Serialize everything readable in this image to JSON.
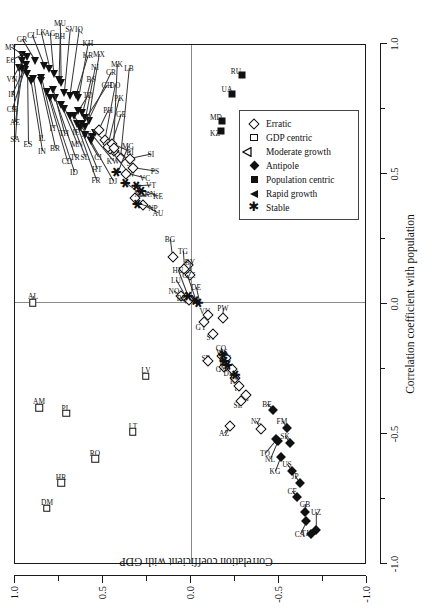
{
  "chart_data": {
    "type": "scatter",
    "title": "",
    "xlabel": "Correlation coefficient with population",
    "ylabel": "Correlation coefficient with GDP",
    "xlim": [
      -1.0,
      1.0
    ],
    "ylim": [
      -1.0,
      1.0
    ],
    "xticks": [
      "-1.0",
      "-0.5",
      "0.0",
      "0.5",
      "1.0"
    ],
    "yticks": [
      "1.0",
      "0.5",
      "0.0",
      "-0.5",
      "-1.0"
    ],
    "grid": false,
    "zero_lines": true,
    "legend_position": "lower right",
    "legend": [
      {
        "label": "Erratic",
        "marker": "open-diamond"
      },
      {
        "label": "GDP centric",
        "marker": "open-square"
      },
      {
        "label": "Moderate growth",
        "marker": "open-triangle-left"
      },
      {
        "label": "Antipole",
        "marker": "filled-diamond"
      },
      {
        "label": "Population centric",
        "marker": "filled-square"
      },
      {
        "label": "Rapid growth",
        "marker": "filled-triangle-left"
      },
      {
        "label": "Stable",
        "marker": "asterisk"
      }
    ],
    "series": [
      {
        "name": "Rapid growth",
        "marker": "filled-triangle-left",
        "points": [
          {
            "label": "SA",
            "x": 0.905,
            "y": 0.975,
            "lx": 0.63,
            "ly": 1.0
          },
          {
            "label": "AE",
            "x": 0.9,
            "y": 0.96,
            "lx": 0.695,
            "ly": 1.0
          },
          {
            "label": "CH",
            "x": 0.898,
            "y": 0.945,
            "lx": 0.745,
            "ly": 1.015
          },
          {
            "label": "IR",
            "x": 0.915,
            "y": 0.94,
            "lx": 0.805,
            "ly": 1.015
          },
          {
            "label": "VN",
            "x": 0.93,
            "y": 0.96,
            "lx": 0.862,
            "ly": 1.015
          },
          {
            "label": "EG",
            "x": 0.955,
            "y": 0.96,
            "lx": 0.935,
            "ly": 1.02
          },
          {
            "label": "MY",
            "x": 0.945,
            "y": 0.93,
            "lx": 0.985,
            "ly": 1.02
          },
          {
            "label": "GR",
            "x": 0.93,
            "y": 0.885,
            "lx": 1.015,
            "ly": 0.96
          },
          {
            "label": "ES",
            "x": 0.88,
            "y": 0.93,
            "lx": 0.612,
            "ly": 0.925
          },
          {
            "label": "IN",
            "x": 0.852,
            "y": 0.91,
            "lx": 0.583,
            "ly": 0.845
          },
          {
            "label": "IL",
            "x": 0.862,
            "y": 0.895,
            "lx": 0.633,
            "ly": 0.845
          },
          {
            "label": "BR",
            "x": 0.852,
            "y": 0.855,
            "lx": 0.595,
            "ly": 0.77
          },
          {
            "label": "IT",
            "x": 0.866,
            "y": 0.85,
            "lx": 0.672,
            "ly": 0.782
          },
          {
            "label": "CL",
            "x": 0.912,
            "y": 0.836,
            "lx": 1.03,
            "ly": 0.905
          },
          {
            "label": "LK",
            "x": 0.9,
            "y": 0.805,
            "lx": 1.043,
            "ly": 0.855
          },
          {
            "label": "AG",
            "x": 0.882,
            "y": 0.78,
            "lx": 1.04,
            "ly": 0.8
          },
          {
            "label": "BH",
            "x": 0.858,
            "y": 0.752,
            "lx": 1.026,
            "ly": 0.745
          },
          {
            "label": "MU",
            "x": 0.846,
            "y": 0.74,
            "lx": 1.075,
            "ly": 0.745
          },
          {
            "label": "SV",
            "x": 0.808,
            "y": 0.72,
            "lx": 1.055,
            "ly": 0.686
          },
          {
            "label": "IQ",
            "x": 0.795,
            "y": 0.69,
            "lx": 1.055,
            "ly": 0.636
          },
          {
            "label": "KR",
            "x": 0.8,
            "y": 0.655,
            "lx": 0.955,
            "ly": 0.585
          },
          {
            "label": "KH",
            "x": 0.788,
            "y": 0.64,
            "lx": 1.0,
            "ly": 0.585
          },
          {
            "label": "TD",
            "x": 0.74,
            "y": 0.64,
            "lx": 0.8,
            "ly": 0.585
          },
          {
            "label": "BS",
            "x": 0.73,
            "y": 0.618,
            "lx": 0.862,
            "ly": 0.568
          },
          {
            "label": "NI",
            "x": 0.712,
            "y": 0.6,
            "lx": 0.908,
            "ly": 0.545
          },
          {
            "label": "MX",
            "x": 0.7,
            "y": 0.582,
            "lx": 0.958,
            "ly": 0.52
          },
          {
            "label": "CD",
            "x": 0.81,
            "y": 0.82,
            "lx": 0.545,
            "ly": 0.705
          },
          {
            "label": "ID",
            "x": 0.79,
            "y": 0.8,
            "lx": 0.505,
            "ly": 0.662
          },
          {
            "label": "TR",
            "x": 0.788,
            "y": 0.775,
            "lx": 0.56,
            "ly": 0.658
          },
          {
            "label": "TH",
            "x": 0.818,
            "y": 0.782,
            "lx": 0.655,
            "ly": 0.72
          },
          {
            "label": "MN",
            "x": 0.76,
            "y": 0.74,
            "lx": 0.612,
            "ly": 0.65
          },
          {
            "label": "IE",
            "x": 0.748,
            "y": 0.72,
            "lx": 0.658,
            "ly": 0.652
          },
          {
            "label": "SL",
            "x": 0.718,
            "y": 0.69,
            "lx": 0.562,
            "ly": 0.6
          },
          {
            "label": "AT",
            "x": 0.718,
            "y": 0.665,
            "lx": 0.65,
            "ly": 0.595
          },
          {
            "label": "GH",
            "x": 0.69,
            "y": 0.62,
            "lx": 0.84,
            "ly": 0.478
          },
          {
            "label": "CR",
            "x": 0.678,
            "y": 0.6,
            "lx": 0.89,
            "ly": 0.452
          },
          {
            "label": "FR",
            "x": 0.688,
            "y": 0.65,
            "lx": 0.472,
            "ly": 0.538
          },
          {
            "label": "HT",
            "x": 0.672,
            "y": 0.632,
            "lx": 0.515,
            "ly": 0.536
          },
          {
            "label": "CI",
            "x": 0.648,
            "y": 0.602,
            "lx": 0.56,
            "ly": 0.528
          },
          {
            "label": "DJ",
            "x": 0.622,
            "y": 0.57,
            "lx": 0.47,
            "ly": 0.442
          },
          {
            "label": "KW",
            "x": 0.64,
            "y": 0.56,
            "lx": 0.545,
            "ly": 0.445
          },
          {
            "label": "NE",
            "x": 0.655,
            "y": 0.545,
            "lx": 0.6,
            "ly": 0.448
          }
        ]
      },
      {
        "name": "Erratic",
        "marker": "open-diamond",
        "points": [
          {
            "label": "PH",
            "x": 0.665,
            "y": 0.525,
            "lx": 0.742,
            "ly": 0.47
          },
          {
            "label": "DO",
            "x": 0.625,
            "y": 0.49,
            "lx": 0.838,
            "ly": 0.43
          },
          {
            "label": "PK",
            "x": 0.61,
            "y": 0.472,
            "lx": 0.79,
            "ly": 0.408
          },
          {
            "label": "MK",
            "x": 0.585,
            "y": 0.44,
            "lx": 0.918,
            "ly": 0.418
          },
          {
            "label": "GE",
            "x": 0.592,
            "y": 0.46,
            "lx": 0.728,
            "ly": 0.395
          },
          {
            "label": "LB",
            "x": 0.558,
            "y": 0.4,
            "lx": 0.905,
            "ly": 0.35
          },
          {
            "label": "RW",
            "x": 0.6,
            "y": 0.47,
            "lx": 0.497,
            "ly": 0.35
          },
          {
            "label": "BI",
            "x": 0.612,
            "y": 0.45,
            "lx": 0.58,
            "ly": 0.348
          },
          {
            "label": "SC",
            "x": 0.596,
            "y": 0.44,
            "lx": 0.54,
            "ly": 0.34
          },
          {
            "label": "SI",
            "x": 0.555,
            "y": 0.345,
            "lx": 0.572,
            "ly": 0.228
          },
          {
            "label": "BG",
            "x": 0.175,
            "y": 0.105,
            "lx": 0.245,
            "ly": 0.118
          },
          {
            "label": "EE",
            "x": 0.145,
            "y": 0.015,
            "lx": 0.108,
            "ly": 0.002
          },
          {
            "label": "BY",
            "x": 0.108,
            "y": 0.008,
            "lx": 0.158,
            "ly": 0.005
          },
          {
            "label": "TG",
            "x": 0.13,
            "y": 0.04,
            "lx": 0.2,
            "ly": 0.048
          },
          {
            "label": "NO",
            "x": 0.028,
            "y": 0.058,
            "lx": 0.045,
            "ly": 0.095
          },
          {
            "label": "LU",
            "x": 0.02,
            "y": 0.03,
            "lx": 0.088,
            "ly": 0.088
          },
          {
            "label": "HU",
            "x": 0.012,
            "y": 0.012,
            "lx": 0.125,
            "ly": 0.075
          },
          {
            "label": "GY",
            "x": -0.075,
            "y": -0.072,
            "lx": -0.092,
            "ly": -0.058
          },
          {
            "label": "VU",
            "x": -0.045,
            "y": -0.095,
            "lx": -0.032,
            "ly": -0.082
          },
          {
            "label": "ST",
            "x": -0.118,
            "y": -0.125,
            "lx": -0.13,
            "ly": -0.115
          },
          {
            "label": "PW",
            "x": -0.058,
            "y": -0.18,
            "lx": -0.02,
            "ly": -0.182
          },
          {
            "label": "SB",
            "x": -0.225,
            "y": -0.095,
            "lx": -0.212,
            "ly": -0.088
          },
          {
            "label": "CO",
            "x": -0.205,
            "y": -0.178,
            "lx": -0.172,
            "ly": -0.172
          },
          {
            "label": "GW",
            "x": -0.245,
            "y": -0.188,
            "lx": -0.255,
            "ly": -0.178
          },
          {
            "label": "KM",
            "x": -0.212,
            "y": -0.198,
            "lx": -0.212,
            "ly": -0.192
          },
          {
            "label": "DK",
            "x": -0.255,
            "y": -0.232,
            "lx": -0.27,
            "ly": -0.218
          },
          {
            "label": "KI",
            "x": -0.288,
            "y": -0.248,
            "lx": -0.3,
            "ly": -0.242
          },
          {
            "label": "FJ",
            "x": -0.318,
            "y": -0.272,
            "lx": -0.328,
            "ly": -0.265
          },
          {
            "label": "SG",
            "x": -0.352,
            "y": -0.315,
            "lx": -0.365,
            "ly": -0.3
          },
          {
            "label": "SE",
            "x": -0.378,
            "y": -0.282,
            "lx": -0.392,
            "ly": -0.268
          },
          {
            "label": "AZ",
            "x": -0.475,
            "y": -0.222,
            "lx": -0.5,
            "ly": -0.19
          },
          {
            "label": "NZ",
            "x": -0.485,
            "y": -0.395,
            "lx": -0.455,
            "ly": -0.37
          },
          {
            "label": "AU",
            "x": 0.375,
            "y": 0.272,
            "lx": 0.345,
            "ly": 0.188
          },
          {
            "label": "KN",
            "x": 0.405,
            "y": 0.318,
            "lx": 0.418,
            "ly": 0.232
          },
          {
            "label": "VC",
            "x": 0.498,
            "y": 0.368,
            "lx": 0.48,
            "ly": 0.262
          },
          {
            "label": "PS",
            "x": 0.52,
            "y": 0.33,
            "lx": 0.508,
            "ly": 0.205
          }
        ]
      },
      {
        "name": "Stable",
        "marker": "asterisk",
        "points": [
          {
            "label": "NG",
            "x": 0.462,
            "y": 0.372,
            "lx": 0.418,
            "ly": 0.288
          },
          {
            "label": "MG",
            "x": 0.505,
            "y": 0.418,
            "lx": 0.605,
            "ly": 0.36
          },
          {
            "label": "NP",
            "x": 0.382,
            "y": 0.3,
            "lx": 0.365,
            "ly": 0.215
          },
          {
            "label": "VT",
            "x": 0.452,
            "y": 0.305,
            "lx": 0.455,
            "ly": 0.225
          },
          {
            "label": "KE",
            "x": 0.432,
            "y": 0.278,
            "lx": 0.412,
            "ly": 0.19
          },
          {
            "label": "BD",
            "x": 0.028,
            "y": 0.012,
            "lx": 0.018,
            "ly": 0.052
          },
          {
            "label": "CZ",
            "x": 0.01,
            "y": -0.028,
            "lx": 0.108,
            "ly": 0.022
          },
          {
            "label": "DE",
            "x": 0.002,
            "y": -0.048,
            "lx": 0.062,
            "ly": -0.028
          },
          {
            "label": "WS",
            "x": -0.198,
            "y": -0.188,
            "lx": -0.19,
            "ly": -0.178
          },
          {
            "label": "FI",
            "x": -0.222,
            "y": -0.195,
            "lx": -0.228,
            "ly": -0.182
          },
          {
            "label": "MT",
            "x": -0.238,
            "y": -0.212,
            "lx": -0.248,
            "ly": -0.2
          },
          {
            "label": "PG",
            "x": -0.275,
            "y": -0.255,
            "lx": -0.285,
            "ly": -0.248
          }
        ]
      },
      {
        "name": "GDP centric",
        "marker": "open-square",
        "points": [
          {
            "label": "AL",
            "x": 0.0,
            "y": 0.898,
            "lx": 0.028,
            "ly": 0.898
          },
          {
            "label": "AM",
            "x": -0.402,
            "y": 0.862,
            "lx": -0.378,
            "ly": 0.862
          },
          {
            "label": "PL",
            "x": -0.425,
            "y": 0.708,
            "lx": -0.402,
            "ly": 0.708
          },
          {
            "label": "RO",
            "x": -0.6,
            "y": 0.545,
            "lx": -0.578,
            "ly": 0.545
          },
          {
            "label": "HR",
            "x": -0.692,
            "y": 0.738,
            "lx": -0.668,
            "ly": 0.738
          },
          {
            "label": "DM",
            "x": -0.79,
            "y": 0.82,
            "lx": -0.765,
            "ly": 0.82
          },
          {
            "label": "LT",
            "x": -0.495,
            "y": 0.332,
            "lx": -0.472,
            "ly": 0.332
          },
          {
            "label": "LV",
            "x": -0.282,
            "y": 0.258,
            "lx": -0.258,
            "ly": 0.258
          }
        ]
      },
      {
        "name": "Population centric",
        "marker": "filled-square",
        "points": [
          {
            "label": "KZ",
            "x": 0.662,
            "y": -0.168,
            "lx": 0.655,
            "ly": -0.135
          },
          {
            "label": "MD",
            "x": 0.7,
            "y": -0.175,
            "lx": 0.715,
            "ly": -0.142
          },
          {
            "label": "UA",
            "x": 0.805,
            "y": -0.235,
            "lx": 0.822,
            "ly": -0.205
          },
          {
            "label": "RU",
            "x": 0.875,
            "y": -0.288,
            "lx": 0.892,
            "ly": -0.258
          }
        ]
      },
      {
        "name": "Antipole",
        "marker": "filled-diamond",
        "points": [
          {
            "label": "BE",
            "x": -0.412,
            "y": -0.468,
            "lx": -0.388,
            "ly": -0.43
          },
          {
            "label": "TO",
            "x": -0.525,
            "y": -0.485,
            "lx": -0.578,
            "ly": -0.42
          },
          {
            "label": "NL",
            "x": -0.53,
            "y": -0.492,
            "lx": -0.6,
            "ly": -0.448
          },
          {
            "label": "KG",
            "x": -0.592,
            "y": -0.51,
            "lx": -0.648,
            "ly": -0.478
          },
          {
            "label": "FM",
            "x": -0.482,
            "y": -0.548,
            "lx": -0.455,
            "ly": -0.518
          },
          {
            "label": "SK",
            "x": -0.54,
            "y": -0.562,
            "lx": -0.512,
            "ly": -0.535
          },
          {
            "label": "US",
            "x": -0.648,
            "y": -0.575,
            "lx": -0.62,
            "ly": -0.548
          },
          {
            "label": "JP",
            "x": -0.692,
            "y": -0.618,
            "lx": -0.665,
            "ly": -0.592
          },
          {
            "label": "CF",
            "x": -0.745,
            "y": -0.605,
            "lx": -0.722,
            "ly": -0.575
          },
          {
            "label": "GB",
            "x": -0.805,
            "y": -0.65,
            "lx": -0.775,
            "ly": -0.645
          },
          {
            "label": "CA",
            "x": -0.838,
            "y": -0.655,
            "lx": -0.888,
            "ly": -0.618
          },
          {
            "label": "TJ",
            "x": -0.888,
            "y": -0.68,
            "lx": -0.885,
            "ly": -0.645
          },
          {
            "label": "UZ",
            "x": -0.872,
            "y": -0.712,
            "lx": -0.805,
            "ly": -0.712
          }
        ]
      }
    ]
  }
}
